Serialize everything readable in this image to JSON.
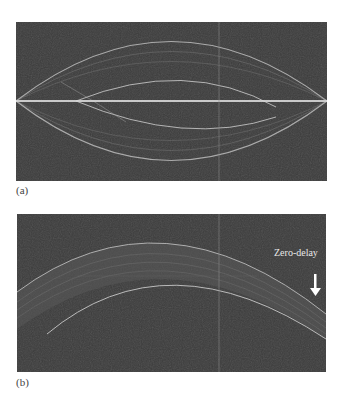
{
  "figure": {
    "panels": [
      {
        "id": "a",
        "label": "(a)",
        "description": "OCT B-scan with mirrored (complex-conjugate) corneal image symmetric about the zero-delay line"
      },
      {
        "id": "b",
        "label": "(b)",
        "description": "OCT B-scan of cornea with mirror image removed, zero-delay indicated"
      }
    ],
    "annotations": {
      "zero_delay": "Zero-delay"
    },
    "colors": {
      "background": "#3b3b3b",
      "signal": "#cfcfcf",
      "arrow": "#ffffff"
    }
  }
}
